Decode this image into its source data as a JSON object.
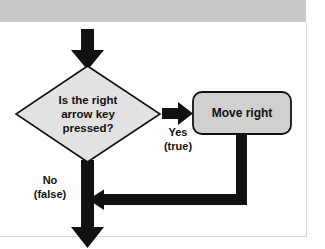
{
  "figure": {
    "type": "flowchart",
    "title": "",
    "background_band_color": "#c9c9c9",
    "panel_color": "#ffffff",
    "stroke_color": "#111111",
    "nodes": [
      {
        "id": "decision",
        "shape": "diamond",
        "fill": "#e2e2e2",
        "lines": [
          "Is the right",
          "arrow key",
          "pressed?"
        ]
      },
      {
        "id": "action",
        "shape": "rounded-rect",
        "fill": "#d0d0d0",
        "lines": [
          "Move right"
        ]
      }
    ],
    "edges": [
      {
        "id": "entry",
        "from": "",
        "to": "decision",
        "label_lines": []
      },
      {
        "id": "yes-branch",
        "from": "decision",
        "to": "action",
        "label_lines": [
          "Yes",
          "(true)"
        ]
      },
      {
        "id": "no-branch",
        "from": "decision",
        "to": "exit",
        "label_lines": [
          "No",
          "(false)"
        ]
      },
      {
        "id": "return",
        "from": "action",
        "to": "no-branch",
        "label_lines": []
      }
    ]
  }
}
